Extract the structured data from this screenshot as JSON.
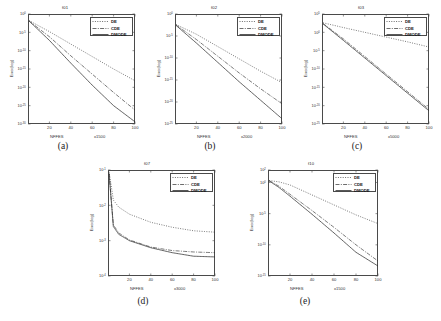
{
  "figure": {
    "background": "#ffffff",
    "axis_color": "#4a4a4a",
    "text_color": "#333333"
  },
  "legend_common": {
    "entries": [
      {
        "label": "DE",
        "style": "dotted"
      },
      {
        "label": "CDE",
        "style": "dashdot"
      },
      {
        "label": "DMODE",
        "style": "solid"
      }
    ]
  },
  "captions": {
    "a": "(a)",
    "b": "(b)",
    "c": "(c)",
    "d": "(d)",
    "e": "(e)"
  },
  "axis_text": {
    "ylabel": "Error(log)",
    "xlabel": "NFFES"
  },
  "panels": {
    "a": {
      "title": "f01",
      "xmult": "x1500",
      "xticks": [
        "20",
        "40",
        "60",
        "80",
        "100"
      ],
      "yticks": [
        "10^0",
        "10^-5",
        "10^-10",
        "10^-15",
        "10^-20",
        "10^-25",
        "10^-30"
      ]
    },
    "b": {
      "title": "f02",
      "xmult": "x2000",
      "xticks": [
        "20",
        "40",
        "60",
        "80",
        "100"
      ],
      "yticks": [
        "10^0",
        "10^-5",
        "10^-10",
        "10^-15",
        "10^-20",
        "10^-25"
      ]
    },
    "c": {
      "title": "f03",
      "xmult": "x5000",
      "xticks": [
        "20",
        "40",
        "60",
        "80",
        "100"
      ],
      "yticks": [
        "10^5",
        "10^0",
        "10^-5",
        "10^-10",
        "10^-15",
        "10^-20",
        "10^-25"
      ]
    },
    "d": {
      "title": "f07",
      "xmult": "x3000",
      "xticks": [
        "20",
        "40",
        "60",
        "80",
        "100"
      ],
      "yticks": [
        "10^-1",
        "10^-2",
        "10^-3",
        "10^-4"
      ]
    },
    "e": {
      "title": "f10",
      "xmult": "x1500",
      "xticks": [
        "20",
        "40",
        "60",
        "80",
        "100"
      ],
      "yticks": [
        "10^2",
        "10^0",
        "10^-5",
        "10^-10",
        "10^-15"
      ]
    }
  },
  "chart_data": [
    {
      "id": "a",
      "type": "line",
      "title": "f01",
      "xlabel": "NFFES",
      "ylabel": "Error(log)",
      "x_multiplier": "x1500",
      "yscale": "log",
      "xlim": [
        0,
        100
      ],
      "ylim_exp": [
        -30,
        0
      ],
      "xticks": [
        20,
        40,
        60,
        80,
        100
      ],
      "ytick_exps": [
        0,
        -5,
        -10,
        -15,
        -20,
        -25,
        -30
      ],
      "grid": false,
      "legend_position": "upper right",
      "series": [
        {
          "name": "DE",
          "style": "dotted",
          "x": [
            1,
            20,
            40,
            60,
            80,
            100
          ],
          "y_exp": [
            -1.8,
            -4.8,
            -8.2,
            -11.6,
            -15.0,
            -18.2
          ]
        },
        {
          "name": "CDE",
          "style": "dashdot",
          "x": [
            1,
            20,
            40,
            60,
            80,
            100
          ],
          "y_exp": [
            -1.9,
            -6.2,
            -11.4,
            -16.4,
            -21.4,
            -26.2
          ]
        },
        {
          "name": "DMODE",
          "style": "solid",
          "x": [
            1,
            20,
            40,
            60,
            80,
            100
          ],
          "y_exp": [
            -1.9,
            -7.2,
            -13.4,
            -19.4,
            -25.0,
            -29.4
          ]
        }
      ]
    },
    {
      "id": "b",
      "type": "line",
      "title": "f02",
      "xlabel": "NFFES",
      "ylabel": "Error(log)",
      "x_multiplier": "x2000",
      "yscale": "log",
      "xlim": [
        0,
        100
      ],
      "ylim_exp": [
        -25,
        0
      ],
      "xticks": [
        20,
        40,
        60,
        80,
        100
      ],
      "ytick_exps": [
        0,
        -5,
        -10,
        -15,
        -20,
        -25
      ],
      "grid": false,
      "legend_position": "upper right",
      "series": [
        {
          "name": "DE",
          "style": "dotted",
          "x": [
            1,
            20,
            40,
            60,
            80,
            100
          ],
          "y_exp": [
            -2.4,
            -4.6,
            -7.4,
            -10.2,
            -13.0,
            -15.6
          ]
        },
        {
          "name": "CDE",
          "style": "dashdot",
          "x": [
            1,
            20,
            40,
            60,
            80,
            100
          ],
          "y_exp": [
            -2.5,
            -5.8,
            -9.6,
            -13.4,
            -17.0,
            -20.4
          ]
        },
        {
          "name": "DMODE",
          "style": "solid",
          "x": [
            1,
            20,
            40,
            60,
            80,
            100
          ],
          "y_exp": [
            -2.6,
            -6.6,
            -11.0,
            -15.4,
            -19.6,
            -23.8
          ]
        }
      ]
    },
    {
      "id": "c",
      "type": "line",
      "title": "f03",
      "xlabel": "NFFES",
      "ylabel": "Error(log)",
      "x_multiplier": "x5000",
      "yscale": "log",
      "xlim": [
        0,
        100
      ],
      "ylim_exp": [
        -25,
        5
      ],
      "xticks": [
        20,
        40,
        60,
        80,
        100
      ],
      "ytick_exps": [
        5,
        0,
        -5,
        -10,
        -15,
        -20,
        -25
      ],
      "grid": false,
      "legend_position": "upper right",
      "series": [
        {
          "name": "DE",
          "style": "dotted",
          "x": [
            1,
            20,
            40,
            60,
            80,
            100
          ],
          "y_exp": [
            2.6,
            1.3,
            0.0,
            -1.3,
            -2.6,
            -4.0
          ]
        },
        {
          "name": "CDE",
          "style": "dashdot",
          "x": [
            1,
            20,
            40,
            60,
            80,
            100
          ],
          "y_exp": [
            2.4,
            -1.8,
            -6.6,
            -11.4,
            -16.2,
            -21.0
          ]
        },
        {
          "name": "DMODE",
          "style": "solid",
          "x": [
            1,
            20,
            40,
            60,
            80,
            100
          ],
          "y_exp": [
            2.3,
            -2.2,
            -7.0,
            -11.8,
            -16.6,
            -21.4
          ]
        }
      ]
    },
    {
      "id": "d",
      "type": "line",
      "title": "f07",
      "xlabel": "NFFES",
      "ylabel": "Error(log)",
      "x_multiplier": "x3000",
      "yscale": "log",
      "xlim": [
        0,
        100
      ],
      "ylim_exp": [
        -4,
        -1
      ],
      "xticks": [
        20,
        40,
        60,
        80,
        100
      ],
      "ytick_exps": [
        -1,
        -2,
        -3,
        -4
      ],
      "grid": false,
      "legend_position": "upper right",
      "series": [
        {
          "name": "DE",
          "style": "dotted",
          "x": [
            1,
            5,
            10,
            20,
            40,
            60,
            80,
            100
          ],
          "y_exp": [
            -1.05,
            -1.85,
            -2.05,
            -2.25,
            -2.48,
            -2.62,
            -2.72,
            -2.76
          ]
        },
        {
          "name": "CDE",
          "style": "dashdot",
          "x": [
            1,
            5,
            10,
            20,
            40,
            60,
            80,
            100
          ],
          "y_exp": [
            -1.1,
            -2.55,
            -2.78,
            -2.98,
            -3.18,
            -3.28,
            -3.32,
            -3.34
          ]
        },
        {
          "name": "DMODE",
          "style": "solid",
          "x": [
            1,
            5,
            10,
            20,
            40,
            60,
            80,
            100
          ],
          "y_exp": [
            -1.1,
            -2.6,
            -2.82,
            -3.0,
            -3.2,
            -3.34,
            -3.44,
            -3.46
          ]
        }
      ]
    },
    {
      "id": "e",
      "type": "line",
      "title": "f10",
      "xlabel": "NFFES",
      "ylabel": "Error(log)",
      "x_multiplier": "x1500",
      "yscale": "log",
      "xlim": [
        0,
        100
      ],
      "ylim_exp": [
        -15,
        2
      ],
      "xticks": [
        20,
        40,
        60,
        80,
        100
      ],
      "ytick_exps": [
        2,
        0,
        -5,
        -10,
        -15
      ],
      "grid": false,
      "legend_position": "upper right",
      "series": [
        {
          "name": "DE",
          "style": "dotted",
          "x": [
            1,
            10,
            20,
            40,
            60,
            80,
            100
          ],
          "y_exp": [
            0.3,
            0.1,
            -0.4,
            -2.0,
            -3.6,
            -5.2,
            -6.6
          ]
        },
        {
          "name": "CDE",
          "style": "dashdot",
          "x": [
            1,
            10,
            20,
            40,
            60,
            80,
            100
          ],
          "y_exp": [
            0.3,
            -0.6,
            -1.9,
            -4.5,
            -7.2,
            -10.0,
            -12.6
          ]
        },
        {
          "name": "DMODE",
          "style": "solid",
          "x": [
            1,
            10,
            20,
            40,
            60,
            80,
            100
          ],
          "y_exp": [
            0.25,
            -0.8,
            -2.2,
            -5.1,
            -8.1,
            -11.2,
            -13.4
          ]
        }
      ]
    }
  ]
}
